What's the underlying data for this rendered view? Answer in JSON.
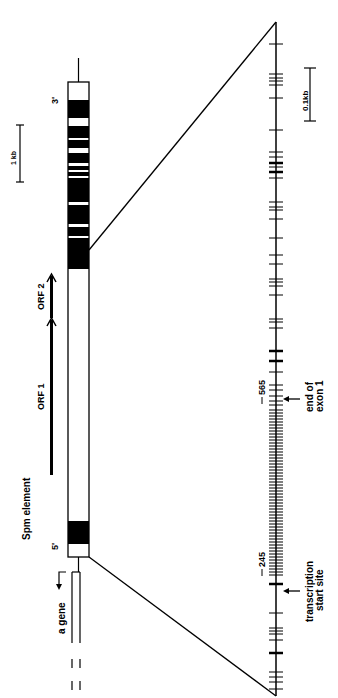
{
  "labels": {
    "element": "Spm element",
    "five_prime": "5'",
    "three_prime": "3'",
    "gene": "a gene",
    "orf1": "ORF 1",
    "orf2": "ORF 2",
    "scale_large": "1 kb",
    "scale_small": "0.1kb",
    "pos_565": "565",
    "pos_245": "245",
    "exon_end_line1": "end of",
    "exon_end_line2": "exon 1",
    "tss_line1": "transcription",
    "tss_line2": "start site"
  },
  "colors": {
    "ink": "#000000",
    "paper": "#ffffff"
  },
  "element": {
    "x": 68,
    "width": 21,
    "top": 82,
    "bottom": 557,
    "black_blocks": [
      [
        100,
        118
      ],
      [
        126,
        138
      ],
      [
        140,
        148
      ],
      [
        153,
        163
      ],
      [
        166,
        170
      ],
      [
        172,
        176
      ],
      [
        178,
        202
      ],
      [
        205,
        224
      ],
      [
        227,
        236
      ],
      [
        238,
        269
      ],
      [
        521,
        544
      ]
    ]
  },
  "axis": {
    "x": 276,
    "top": 22,
    "bottom": 696,
    "ticks": [
      44,
      74,
      78,
      81,
      85,
      98,
      130,
      152,
      157,
      163,
      167,
      172,
      178,
      202,
      207,
      210,
      219,
      238,
      255,
      264,
      279,
      282,
      286,
      295,
      319,
      322,
      328,
      351,
      361,
      372,
      385,
      390,
      396,
      401,
      405,
      410,
      413,
      416,
      419,
      422,
      425,
      428,
      431,
      434,
      437,
      440,
      443,
      446,
      449,
      452,
      455,
      458,
      461,
      464,
      467,
      470,
      473,
      476,
      479,
      482,
      485,
      488,
      491,
      494,
      497,
      500,
      503,
      506,
      509,
      512,
      515,
      518,
      521,
      524,
      527,
      530,
      533,
      536,
      539,
      542,
      545,
      548,
      551,
      554,
      557,
      560,
      563,
      566,
      569,
      572,
      575,
      584,
      613,
      628,
      631,
      634,
      640,
      653,
      672,
      677,
      682,
      689
    ],
    "bold_ticks": [
      163,
      172,
      351,
      361,
      584,
      653
    ]
  }
}
